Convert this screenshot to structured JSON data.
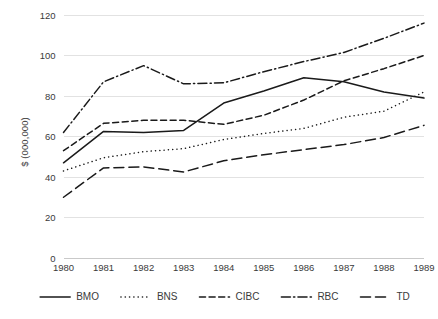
{
  "chart_data": {
    "type": "line",
    "title": "",
    "xlabel": "",
    "ylabel": "$ (000,000)",
    "x": [
      1980,
      1981,
      1982,
      1983,
      1984,
      1985,
      1986,
      1987,
      1988,
      1989
    ],
    "categories": [
      "1980",
      "1981",
      "1982",
      "1983",
      "1984",
      "1985",
      "1986",
      "1987",
      "1988",
      "1989"
    ],
    "ylim": [
      0,
      120
    ],
    "yticks": [
      0,
      20,
      40,
      60,
      80,
      100,
      120
    ],
    "ytick_labels": [
      "0",
      "20",
      "40",
      "60",
      "80",
      "100",
      "120"
    ],
    "grid": true,
    "legend_position": "bottom",
    "series": [
      {
        "name": "BMO",
        "style": "solid",
        "color": "#1a1a1a",
        "values": [
          47,
          62.5,
          62,
          63,
          76.5,
          82.5,
          89,
          87,
          82,
          79
        ]
      },
      {
        "name": "BNS",
        "style": "dotted",
        "color": "#1a1a1a",
        "values": [
          43,
          49.5,
          52.5,
          54,
          58.5,
          61.5,
          64,
          69.5,
          72.5,
          82
        ]
      },
      {
        "name": "CIBC",
        "style": "dashed",
        "color": "#1a1a1a",
        "values": [
          53,
          66.5,
          68,
          68,
          66,
          70.5,
          78,
          87.5,
          93.5,
          100
        ]
      },
      {
        "name": "RBC",
        "style": "dashdot",
        "color": "#1a1a1a",
        "values": [
          62,
          87,
          95,
          86,
          86.5,
          92,
          97,
          101.5,
          108.5,
          116
        ]
      },
      {
        "name": "TD",
        "style": "longdash",
        "color": "#1a1a1a",
        "values": [
          30,
          44.5,
          45,
          42.5,
          48,
          51,
          53.5,
          56,
          59.5,
          65.5
        ]
      }
    ]
  },
  "legend": {
    "items": [
      {
        "label": "BMO",
        "style": "solid"
      },
      {
        "label": "BNS",
        "style": "dotted"
      },
      {
        "label": "CIBC",
        "style": "dashed"
      },
      {
        "label": "RBC",
        "style": "dashdot"
      },
      {
        "label": "TD",
        "style": "longdash"
      }
    ]
  }
}
